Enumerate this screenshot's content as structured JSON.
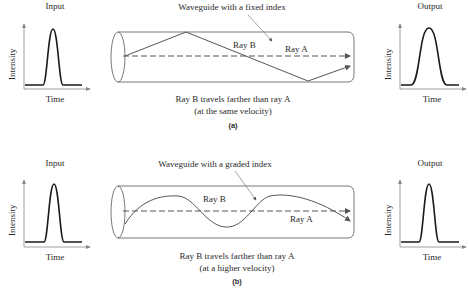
{
  "panel_a": {
    "input_title": "Input",
    "output_title": "Output",
    "y_label": "Intensity",
    "x_label": "Time",
    "waveguide_label": "Waveguide with a fixed index",
    "ray_b": "Ray B",
    "ray_a": "Ray A",
    "caption_line1": "Ray B travels farther than ray A",
    "caption_line2": "(at the same velocity)",
    "sub_label": "(a)"
  },
  "panel_b": {
    "input_title": "Input",
    "output_title": "Output",
    "y_label": "Intensity",
    "x_label": "Time",
    "waveguide_label": "Waveguide with a graded index",
    "ray_b": "Ray B",
    "ray_a": "Ray A",
    "caption_line1": "Ray B travels farther than ray A",
    "caption_line2": "(at a higher velocity)",
    "sub_label": "(b)"
  },
  "colors": {
    "line": "#333333",
    "pulse": "#1a1a1a",
    "axis": "#777777"
  }
}
